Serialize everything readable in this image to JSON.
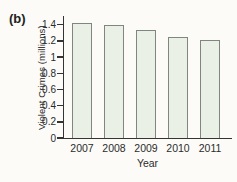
{
  "panel_label": "(b)",
  "chart_data": {
    "type": "bar",
    "title": "",
    "xlabel": "Year",
    "ylabel": "Violent Crimes (millions)",
    "categories": [
      "2007",
      "2008",
      "2009",
      "2010",
      "2011"
    ],
    "values": [
      1.42,
      1.39,
      1.33,
      1.25,
      1.21
    ],
    "yticks": [
      0,
      0.2,
      0.4,
      0.6,
      0.8,
      1,
      1.2,
      1.4
    ],
    "ylim": [
      0,
      1.5
    ],
    "grid": false,
    "legend": "none",
    "colors": {
      "bar_fill": "#ebf0e7",
      "bar_border": "#7e877e",
      "axis": "#343434",
      "text": "#2b2b2b",
      "background": "#fcfbf8"
    }
  }
}
